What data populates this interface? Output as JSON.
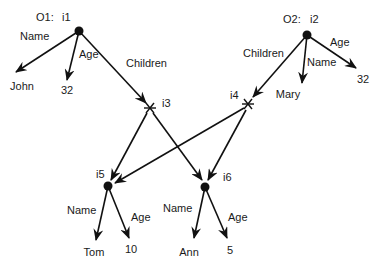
{
  "diagram": {
    "objects": [
      {
        "id": "i1",
        "prefix": "O1:",
        "label": "i1",
        "x": 79,
        "y": 31,
        "type": "object",
        "label_x": 62,
        "label_y": 21,
        "prefix_x": 36,
        "prefix_y": 21
      },
      {
        "id": "i2",
        "prefix": "O2:",
        "label": "i2",
        "x": 307,
        "y": 35,
        "type": "object",
        "label_x": 310,
        "label_y": 23,
        "prefix_x": 283,
        "prefix_y": 23
      }
    ],
    "nodes": [
      {
        "id": "i3",
        "label": "i3",
        "x": 150,
        "y": 108,
        "type": "set",
        "label_x": 162,
        "label_y": 107
      },
      {
        "id": "i4",
        "label": "i4",
        "x": 248,
        "y": 104,
        "type": "set",
        "label_x": 230,
        "label_y": 99
      },
      {
        "id": "i5",
        "label": "i5",
        "x": 108,
        "y": 186,
        "type": "object",
        "label_x": 96,
        "label_y": 178
      },
      {
        "id": "i6",
        "label": "i6",
        "x": 205,
        "y": 187,
        "type": "object",
        "label_x": 223,
        "label_y": 181
      }
    ],
    "values": [
      {
        "id": "john",
        "text": "John",
        "x": 22,
        "y": 90
      },
      {
        "id": "age32a",
        "text": "32",
        "x": 67,
        "y": 94
      },
      {
        "id": "mary",
        "text": "Mary",
        "x": 288,
        "y": 98
      },
      {
        "id": "age32b",
        "text": "32",
        "x": 363,
        "y": 83
      },
      {
        "id": "tom",
        "text": "Tom",
        "x": 94,
        "y": 256
      },
      {
        "id": "age10",
        "text": "10",
        "x": 131,
        "y": 253
      },
      {
        "id": "ann",
        "text": "Ann",
        "x": 189,
        "y": 256
      },
      {
        "id": "age5",
        "text": "5",
        "x": 230,
        "y": 254
      }
    ],
    "edges": [
      {
        "from": [
          79,
          31
        ],
        "to": [
          16,
          72
        ],
        "label": "Name",
        "lx": 20,
        "ly": 40
      },
      {
        "from": [
          79,
          31
        ],
        "to": [
          67,
          80
        ],
        "label": "Age",
        "lx": 79,
        "ly": 58
      },
      {
        "from": [
          79,
          31
        ],
        "to": [
          146,
          103
        ],
        "label": "Children",
        "lx": 126,
        "ly": 67
      },
      {
        "from": [
          307,
          35
        ],
        "to": [
          253,
          97
        ],
        "label": "Children",
        "lx": 243,
        "ly": 57
      },
      {
        "from": [
          307,
          35
        ],
        "to": [
          302,
          83
        ],
        "label": "Name",
        "lx": 307,
        "ly": 66
      },
      {
        "from": [
          307,
          35
        ],
        "to": [
          356,
          68
        ],
        "label": "Age",
        "lx": 330,
        "ly": 46
      },
      {
        "from": [
          147,
          113
        ],
        "to": [
          111,
          180
        ],
        "label": "",
        "lx": 0,
        "ly": 0
      },
      {
        "from": [
          153,
          113
        ],
        "to": [
          202,
          180
        ],
        "label": "",
        "lx": 0,
        "ly": 0
      },
      {
        "from": [
          244,
          108
        ],
        "to": [
          115,
          183
        ],
        "label": "",
        "lx": 0,
        "ly": 0
      },
      {
        "from": [
          246,
          110
        ],
        "to": [
          208,
          180
        ],
        "label": "",
        "lx": 0,
        "ly": 0
      },
      {
        "from": [
          108,
          186
        ],
        "to": [
          96,
          240
        ],
        "label": "Name",
        "lx": 67,
        "ly": 214
      },
      {
        "from": [
          108,
          186
        ],
        "to": [
          129,
          238
        ],
        "label": "Age",
        "lx": 131,
        "ly": 221
      },
      {
        "from": [
          205,
          187
        ],
        "to": [
          194,
          238
        ],
        "label": "Name",
        "lx": 163,
        "ly": 212
      },
      {
        "from": [
          205,
          187
        ],
        "to": [
          227,
          238
        ],
        "label": "Age",
        "lx": 228,
        "ly": 221
      }
    ]
  }
}
